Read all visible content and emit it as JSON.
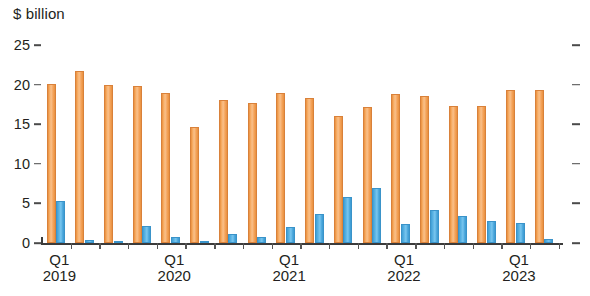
{
  "chart_data": {
    "type": "bar",
    "title": "",
    "subtitle": "",
    "unit_label": "$ billion",
    "ylabel": "$ billion",
    "xlabel": "",
    "ylim": [
      0,
      25
    ],
    "yticks": [
      0,
      5,
      10,
      15,
      20,
      25
    ],
    "ytick_labels": [
      "0",
      "5",
      "10",
      "15",
      "20",
      "25"
    ],
    "grid": false,
    "legend_position": "none",
    "categories": [
      "Q1 2019",
      "Q2 2019",
      "Q3 2019",
      "Q4 2019",
      "Q1 2020",
      "Q2 2020",
      "Q3 2020",
      "Q4 2020",
      "Q1 2021",
      "Q2 2021",
      "Q3 2021",
      "Q4 2021",
      "Q1 2022",
      "Q2 2022",
      "Q3 2022",
      "Q4 2022",
      "Q1 2023",
      "Q2 2023"
    ],
    "series": [
      {
        "name": "orange-series",
        "color": "#f4a259",
        "values": [
          20.1,
          21.7,
          20.0,
          19.8,
          19.0,
          14.6,
          18.0,
          17.7,
          19.0,
          18.3,
          16.0,
          17.2,
          18.8,
          18.5,
          17.3,
          17.3,
          19.3,
          19.3
        ]
      },
      {
        "name": "blue-series",
        "color": "#4ea9dd",
        "values": [
          5.3,
          0.4,
          0.3,
          2.2,
          0.8,
          0.1,
          1.2,
          0.8,
          2.0,
          3.7,
          5.8,
          7.0,
          2.4,
          4.2,
          3.4,
          2.8,
          2.5,
          0.5
        ]
      }
    ],
    "xtick_labels": [
      {
        "quarter": "Q1",
        "year": "2019"
      },
      {
        "quarter": "Q1",
        "year": "2020"
      },
      {
        "quarter": "Q1",
        "year": "2021"
      },
      {
        "quarter": "Q1",
        "year": "2022"
      },
      {
        "quarter": "Q1",
        "year": "2023"
      }
    ],
    "colors": {
      "orange": "#f4a259",
      "orange_border": "#d9813a",
      "blue": "#4ea9dd",
      "blue_border": "#3a93c9",
      "axis": "#3b3b3b",
      "text": "#231f20",
      "background": "#ffffff"
    }
  }
}
